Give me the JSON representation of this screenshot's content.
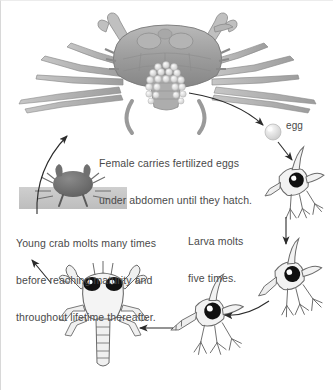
{
  "figure": {
    "background_color": "#ffffff",
    "text_color": "#4a4a4a"
  },
  "labels": {
    "female_caption_line1": "Female carries fertilized eggs",
    "female_caption_line2": "under abdomen until they hatch.",
    "egg": "egg",
    "larva_caption_line1": "Larva molts",
    "larva_caption_line2": "five times.",
    "young_caption_line1": "Young crab molts many times",
    "young_caption_line2": "before reaching maturity and",
    "young_caption_line3": "throughout lifetime thereafter."
  },
  "stages": [
    {
      "id": "adult-female-crab",
      "name": "Adult female crab carrying egg mass"
    },
    {
      "id": "egg",
      "name": "Egg"
    },
    {
      "id": "larva-zoea-1",
      "name": "Larva (zoea) stage 1"
    },
    {
      "id": "larva-zoea-2",
      "name": "Larva (zoea) stage 2"
    },
    {
      "id": "larva-zoea-3",
      "name": "Larva (zoea) stage 3"
    },
    {
      "id": "megalopa",
      "name": "Megalopa / young crab stage"
    },
    {
      "id": "young-crab-photo",
      "name": "Young crab photograph"
    }
  ],
  "arrows": [
    {
      "id": "arrow-eggmass-to-egg",
      "from": "adult-female-crab",
      "to": "egg",
      "shape": "curve"
    },
    {
      "id": "arrow-egg-to-larva1",
      "from": "egg",
      "to": "larva-zoea-1",
      "shape": "straight"
    },
    {
      "id": "arrow-larva1-to-larva2",
      "from": "larva-zoea-1",
      "to": "larva-zoea-2",
      "shape": "straight"
    },
    {
      "id": "arrow-larva2-to-larva3",
      "from": "larva-zoea-2",
      "to": "larva-zoea-3",
      "shape": "curve"
    },
    {
      "id": "arrow-larva3-to-megalopa",
      "from": "larva-zoea-3",
      "to": "megalopa",
      "shape": "straight"
    },
    {
      "id": "arrow-megalopa-to-youngcrab",
      "from": "megalopa",
      "to": "young-crab-photo",
      "shape": "straight"
    },
    {
      "id": "arrow-youngcrab-to-adult",
      "from": "young-crab-photo",
      "to": "adult-female-crab",
      "shape": "curve"
    }
  ],
  "colors": {
    "crab_shell_dark": "#8d8d8d",
    "crab_shell_mid": "#a6a6a6",
    "crab_shell_light": "#c2c2c2",
    "egg_mass": "#efefef",
    "larva_fill": "#f2f2f2",
    "larva_stroke": "#6b6b6b",
    "eye_black": "#111111",
    "photo_band": "#c9c9c9",
    "arrow": "#2b2b2b"
  }
}
